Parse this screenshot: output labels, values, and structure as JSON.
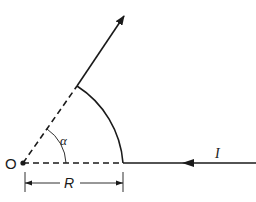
{
  "diagram": {
    "type": "geometry-current-path",
    "labels": {
      "origin": "O",
      "angle": "α",
      "radius": "R",
      "current": "I"
    },
    "colors": {
      "stroke": "#1a1a1a",
      "background": "#ffffff"
    },
    "elements": [
      "incoming straight wire with arrow pointing left (current I)",
      "circular arc of radius R centered at O subtending angle α",
      "outgoing straight wire along radial direction with arrow",
      "dashed radius lines from O",
      "angle arc marking α",
      "dimension line for R"
    ]
  }
}
